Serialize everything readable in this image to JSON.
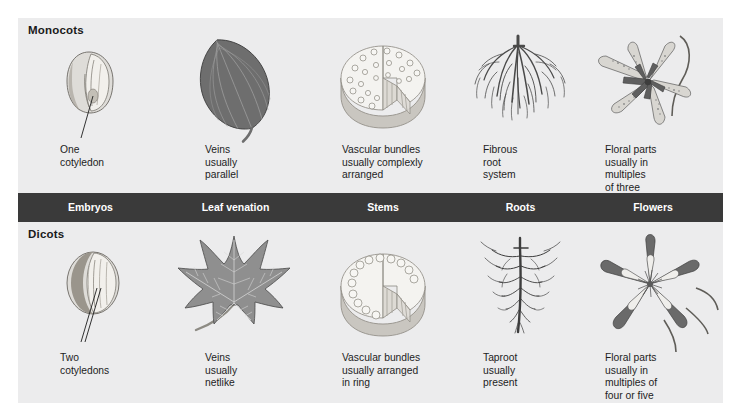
{
  "figure": {
    "background_color": "#ececed",
    "band_color": "#3a3a3a",
    "band_text_color": "#ffffff"
  },
  "groups": [
    {
      "id": "monocots",
      "title": "Monocots"
    },
    {
      "id": "dicots",
      "title": "Dicots"
    }
  ],
  "band": {
    "labels": [
      {
        "id": "embryos",
        "text": "Embryos"
      },
      {
        "id": "leaf-venation",
        "text": "Leaf\nvenation"
      },
      {
        "id": "stems",
        "text": "Stems"
      },
      {
        "id": "roots",
        "text": "Roots"
      },
      {
        "id": "flowers",
        "text": "Flowers"
      }
    ]
  },
  "monocots": {
    "captions": [
      {
        "id": "embryos",
        "text": "One\ncotyledon"
      },
      {
        "id": "leaf-venation",
        "text": "Veins\nusually\nparallel"
      },
      {
        "id": "stems",
        "text": "Vascular bundles\nusually complexly\narranged"
      },
      {
        "id": "roots",
        "text": "Fibrous\nroot\nsystem"
      },
      {
        "id": "flowers",
        "text": "Floral parts\nusually in\nmultiples\nof three"
      }
    ],
    "illustrations": [
      {
        "id": "embryos",
        "name": "monocot-seed-illustration"
      },
      {
        "id": "leaf-venation",
        "name": "monocot-leaf-illustration"
      },
      {
        "id": "stems",
        "name": "monocot-stem-cross-section-illustration"
      },
      {
        "id": "roots",
        "name": "fibrous-root-system-illustration"
      },
      {
        "id": "flowers",
        "name": "monocot-lily-flower-illustration"
      }
    ]
  },
  "dicots": {
    "captions": [
      {
        "id": "embryos",
        "text": "Two\ncotyledons"
      },
      {
        "id": "leaf-venation",
        "text": "Veins\nusually\nnetlike"
      },
      {
        "id": "stems",
        "text": "Vascular bundles\nusually arranged\nin ring"
      },
      {
        "id": "roots",
        "text": "Taproot\nusually\npresent"
      },
      {
        "id": "flowers",
        "text": "Floral parts\nusually in\nmultiples of\nfour or five"
      }
    ],
    "illustrations": [
      {
        "id": "embryos",
        "name": "dicot-seed-illustration"
      },
      {
        "id": "leaf-venation",
        "name": "dicot-leaf-illustration"
      },
      {
        "id": "stems",
        "name": "dicot-stem-cross-section-illustration"
      },
      {
        "id": "roots",
        "name": "taproot-illustration"
      },
      {
        "id": "flowers",
        "name": "dicot-columbine-flower-illustration"
      }
    ]
  }
}
